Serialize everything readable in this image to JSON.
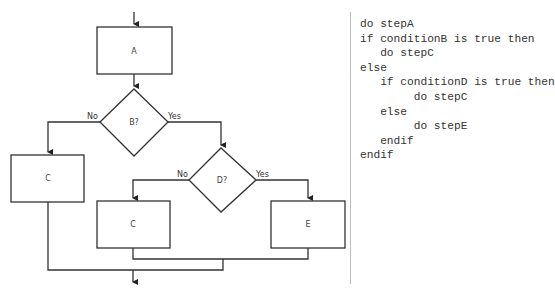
{
  "flowchart": {
    "nodes": {
      "a": "A",
      "b": "B?",
      "c_left": "C",
      "d": "D?",
      "c_mid": "C",
      "e": "E"
    },
    "edges": {
      "b_no": "No",
      "b_yes": "Yes",
      "d_no": "No",
      "d_yes": "Yes"
    },
    "colors": {
      "stroke": "#333333",
      "text": "#444444"
    }
  },
  "pseudocode": {
    "lines": [
      "do stepA",
      "if conditionB is true then",
      "   do stepC",
      "else",
      "   if conditionD is true then",
      "        do stepC",
      "   else",
      "        do stepE",
      "   endif",
      "endif"
    ]
  }
}
